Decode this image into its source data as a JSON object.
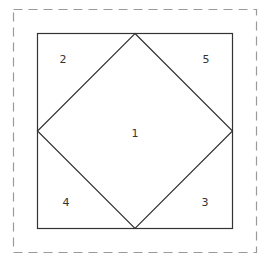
{
  "diagram": {
    "outer_border": {
      "style": "dashed",
      "color": "#9a9a9a"
    },
    "inner_square": {
      "color": "#333333"
    },
    "regions": [
      {
        "id": "center",
        "label": "1"
      },
      {
        "id": "top-left",
        "label": "2"
      },
      {
        "id": "bottom-right",
        "label": "3"
      },
      {
        "id": "bottom-left",
        "label": "4"
      },
      {
        "id": "top-right",
        "label": "5"
      }
    ]
  }
}
